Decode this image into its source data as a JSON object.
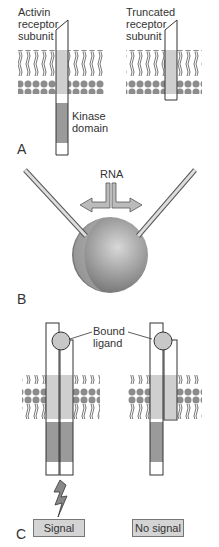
{
  "panelA": {
    "letter": "A",
    "full_receptor_label": [
      "Activin",
      "receptor",
      "subunit"
    ],
    "truncated_receptor_label": [
      "Truncated",
      "receptor",
      "subunit"
    ],
    "kinase_label": [
      "Kinase",
      "domain"
    ]
  },
  "panelB": {
    "letter": "B",
    "rna_label": "RNA"
  },
  "panelC": {
    "letter": "C",
    "ligand_label": [
      "Bound",
      "ligand"
    ],
    "signal_label": "Signal",
    "no_signal_label": "No signal"
  },
  "colors": {
    "membrane": "#8c8c8c",
    "transmembrane": "#cfcfcf",
    "kinase": "#9a9a9a",
    "box": "#d4d4d4"
  }
}
